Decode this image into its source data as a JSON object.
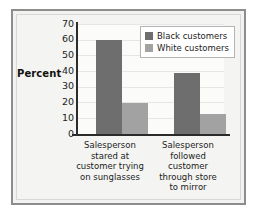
{
  "chart_data": {
    "type": "bar",
    "title": "",
    "xlabel": "",
    "ylabel": "Percent",
    "ylim": [
      0,
      70
    ],
    "ytick_values": [
      0,
      10,
      20,
      30,
      40,
      50,
      60,
      70
    ],
    "ytick_labels": [
      "0",
      "10",
      "20",
      "30",
      "40",
      "50",
      "60",
      "70"
    ],
    "grid": true,
    "legend_position": "upper right",
    "categories": [
      "Salesperson stared at customer trying on sunglasses",
      "Salesperson followed customer through store to mirror"
    ],
    "category_lines": [
      [
        "Salesperson",
        "stared at",
        "customer trying",
        "on sunglasses"
      ],
      [
        "Salesperson",
        "followed",
        "customer",
        "through store",
        "to mirror"
      ]
    ],
    "series": [
      {
        "name": "Black customers",
        "color": "#6e6e6e",
        "values": [
          60,
          39
        ]
      },
      {
        "name": "White customers",
        "color": "#a2a2a2",
        "values": [
          20,
          13
        ]
      }
    ]
  },
  "colors": {
    "panel_border": "#8d8d8d",
    "panel_background": "#f2f2f0",
    "plot_background": "#fbfbfa",
    "axis": "#2b2b2b",
    "gridline": "#e6e6e4",
    "legend_border": "#b4b4b4",
    "text": "#1c1c1c"
  }
}
